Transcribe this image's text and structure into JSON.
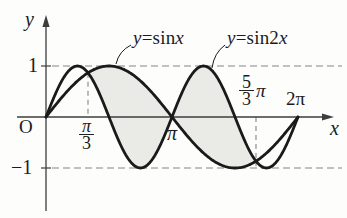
{
  "figure": {
    "background": "#fdfdfb",
    "curve_color": "#1a1a1a",
    "axis_color": "#3d3d3d",
    "dash_color": "#858585",
    "shade_color": "#eaeae6",
    "text_color": "#1b1b1b"
  },
  "chart_data": {
    "type": "line",
    "title": "",
    "x_range": [
      0,
      6.283185
    ],
    "y_range": [
      -1,
      1
    ],
    "series": [
      {
        "name": "y=sinx",
        "function": "sin",
        "frequency": 1
      },
      {
        "name": "y=sin2x",
        "function": "sin",
        "frequency": 2
      }
    ],
    "x_ticks": [
      {
        "value": 1.047198,
        "label": "π/3"
      },
      {
        "value": 3.141593,
        "label": "π"
      },
      {
        "value": 5.235988,
        "label": "5/3 π"
      },
      {
        "value": 6.283185,
        "label": "2π"
      }
    ],
    "y_ticks": [
      {
        "value": 1,
        "label": "1"
      },
      {
        "value": -1,
        "label": "−1"
      }
    ],
    "dashed_guides": {
      "horizontal": [
        1,
        -1
      ],
      "vertical": [
        1.047198,
        5.235988
      ]
    },
    "shaded_region": {
      "between": [
        "y=sinx",
        "y=sin2x"
      ],
      "from": 1.047198,
      "to": 5.235988
    },
    "intersections_x": [
      0,
      1.047198,
      3.141593,
      5.235988,
      6.283185
    ],
    "axis_labels": {
      "x": "x",
      "y": "y"
    },
    "origin_label": "O",
    "annotations": [
      {
        "text": "y=sinx",
        "attach_x": 1.75
      },
      {
        "text": "y=sin2x",
        "attach_x": 4.16
      }
    ],
    "legend_position": "none",
    "grid": false
  },
  "labels": {
    "y_axis": "y",
    "x_axis": "x",
    "origin": "O",
    "y_one": "1",
    "y_neg_one": "−1",
    "pi_third_num": "π",
    "pi_third_den": "3",
    "pi_label": "π",
    "five_third_num": "5",
    "five_third_den": "3",
    "five_third_pi": "π",
    "two_pi": "2π",
    "curve1": {
      "var": "y",
      "mid": "=sin",
      "arg": "x"
    },
    "curve2": {
      "var": "y",
      "mid": "=sin2",
      "arg": "x"
    }
  }
}
